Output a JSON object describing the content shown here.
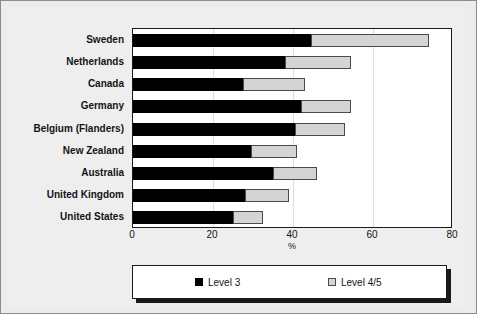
{
  "chart_data": {
    "type": "bar",
    "orientation": "horizontal",
    "stacked": true,
    "title": "",
    "subtitle": "",
    "xlabel": "%",
    "ylabel": "",
    "xlim": [
      0,
      80
    ],
    "xticks": [
      "0",
      "20",
      "40",
      "60",
      "80"
    ],
    "xtick_values": [
      0,
      20,
      40,
      60,
      80
    ],
    "grid": "vertical-faint",
    "legend_position": "bottom",
    "categories": [
      "Sweden",
      "Netherlands",
      "Canada",
      "Germany",
      "Belgium (Flanders)",
      "New Zealand",
      "Australia",
      "United Kingdom",
      "United States"
    ],
    "series": [
      {
        "name": "Level 3",
        "color": "#000000",
        "values": [
          44.5,
          38.0,
          27.5,
          42.0,
          40.5,
          29.5,
          35.0,
          28.0,
          25.0
        ]
      },
      {
        "name": "Level 4/5",
        "color": "#d4d4d4",
        "values": [
          29.5,
          16.5,
          15.5,
          12.5,
          12.5,
          11.5,
          11.0,
          11.0,
          7.5
        ]
      }
    ],
    "totals": [
      74.0,
      54.5,
      43.0,
      54.5,
      53.0,
      41.0,
      46.0,
      39.0,
      32.5
    ]
  },
  "legend": {
    "items": [
      {
        "label": "Level 3",
        "swatch": "black-square-icon"
      },
      {
        "label": "Level 4/5",
        "swatch": "light-gray-square-icon"
      }
    ]
  },
  "colors": {
    "level3": "#000000",
    "level45": "#d4d4d4",
    "frame": "#1a1a1a",
    "background": "#eeeeee",
    "gridline": "#dddddd"
  }
}
